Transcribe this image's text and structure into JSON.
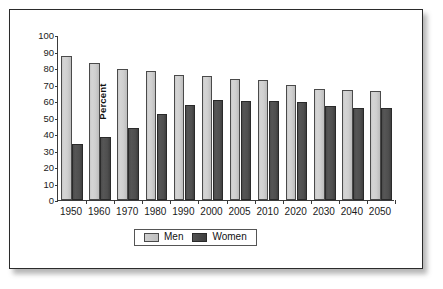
{
  "chart_data": {
    "type": "bar",
    "title": "",
    "xlabel": "",
    "ylabel": "Percent",
    "ylim": [
      0,
      100
    ],
    "ytick_step": 10,
    "yticks": [
      100,
      90,
      80,
      70,
      60,
      50,
      40,
      30,
      20,
      10,
      0
    ],
    "grid": false,
    "legend_position": "bottom-center",
    "categories": [
      "1950",
      "1960",
      "1970",
      "1980",
      "1990",
      "2000",
      "2005",
      "2010",
      "2020",
      "2030",
      "2040",
      "2050"
    ],
    "series": [
      {
        "name": "Men",
        "color": "#cccccc",
        "values": [
          87,
          83,
          79.5,
          78,
          76,
          75,
          73.5,
          73,
          70,
          67,
          66.5,
          66
        ]
      },
      {
        "name": "Women",
        "color": "#4d4d4d",
        "values": [
          34,
          38,
          43.5,
          52,
          57.5,
          60.5,
          60,
          60,
          59.5,
          57,
          55.5,
          55.5
        ]
      }
    ]
  },
  "legend": {
    "items": [
      {
        "label": "Men"
      },
      {
        "label": "Women"
      }
    ]
  },
  "colors": {
    "men_bar": "#cccccc",
    "women_bar": "#4d4d4d",
    "axis": "#3a3a3a",
    "frame": "#2b2b2b",
    "background": "#ffffff"
  }
}
